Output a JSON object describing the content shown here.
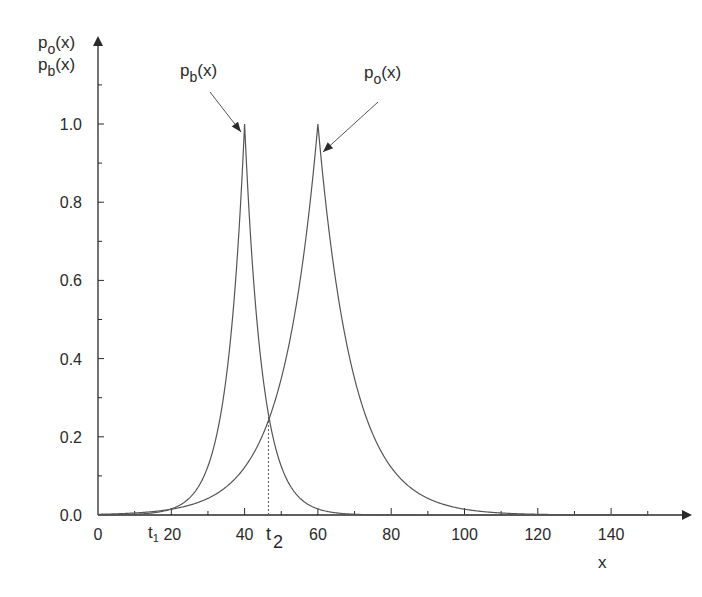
{
  "chart_data": {
    "type": "line",
    "title": "",
    "xlabel": "x",
    "ylabel": [
      "p_o(x)",
      "p_b(x)"
    ],
    "xlim": [
      0,
      150
    ],
    "ylim": [
      0,
      1.15
    ],
    "x_ticks": [
      0,
      20,
      40,
      60,
      80,
      100,
      120,
      140
    ],
    "x_tick_labels": [
      "0",
      "20",
      "40",
      "60",
      "80",
      "100",
      "120",
      "140"
    ],
    "x_minor_ticks": [
      10,
      30,
      50,
      70,
      90,
      110,
      130,
      150
    ],
    "y_ticks": [
      0.0,
      0.2,
      0.4,
      0.6,
      0.8,
      1.0
    ],
    "y_tick_labels": [
      "0.0",
      "0.2",
      "0.4",
      "0.6",
      "0.8",
      "1.0"
    ],
    "y_minor_ticks": [
      0.1,
      0.3,
      0.5,
      0.7,
      0.9,
      1.1
    ],
    "grid": false,
    "legend": null,
    "series": [
      {
        "name": "p_b(x)",
        "label_base": "p",
        "label_sub": "b",
        "label_suffix": "(x)",
        "form": "exp(-|x-40|/4.8)",
        "peak_x": 40,
        "peak_y": 1.0,
        "scale": 4.8,
        "x": [
          0,
          10,
          20,
          30,
          35,
          40,
          45,
          46.5,
          50,
          60,
          70
        ],
        "values": [
          0.0002,
          0.002,
          0.016,
          0.125,
          0.353,
          1.0,
          0.353,
          0.26,
          0.125,
          0.016,
          0.002
        ]
      },
      {
        "name": "p_o(x)",
        "label_base": "p",
        "label_sub": "o",
        "label_suffix": "(x)",
        "form": "exp(-|x-60|/9.5)",
        "peak_x": 60,
        "peak_y": 1.0,
        "scale": 9.5,
        "x": [
          0,
          20,
          30,
          40,
          46.5,
          50,
          60,
          70,
          80,
          100,
          120,
          140
        ],
        "values": [
          0.002,
          0.015,
          0.042,
          0.122,
          0.26,
          0.349,
          1.0,
          0.349,
          0.122,
          0.015,
          0.002,
          0.0002
        ]
      }
    ],
    "annotations": [
      {
        "text": "t",
        "sub": "1",
        "x": 20,
        "position": "below x-axis, left of 20 label"
      },
      {
        "text": "t",
        "sub": "2",
        "x": 46.5,
        "position": "below x-axis at dotted line"
      },
      {
        "type": "dotted_vline",
        "x": 46.5,
        "y_from": 0,
        "y_to": 0.26
      },
      {
        "type": "arrow",
        "label": "p_b(x)",
        "points_to": [
          40,
          0.97
        ]
      },
      {
        "type": "arrow",
        "label": "p_o(x)",
        "points_to": [
          60,
          0.93
        ]
      }
    ]
  },
  "labels": {
    "x_axis": "x",
    "y_axis_line1_base": "p",
    "y_axis_line1_sub": "o",
    "y_axis_line1_suffix": "(x)",
    "y_axis_line2_base": "p",
    "y_axis_line2_sub": "b",
    "y_axis_line2_suffix": "(x)",
    "t1_base": "t",
    "t1_sub": "1",
    "t2_base": "t",
    "t2_sub": "2"
  },
  "colors": {
    "axis": "#2a2a2a",
    "curve": "#555555",
    "text": "#2a2a2a"
  }
}
